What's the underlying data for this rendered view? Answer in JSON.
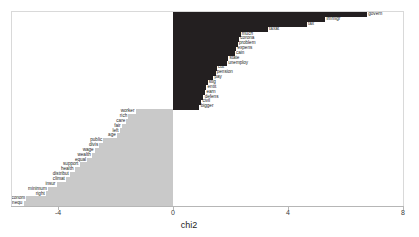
{
  "chart_data": {
    "type": "bar",
    "orientation": "horizontal",
    "title": "",
    "xlabel": "chi2",
    "ylabel": "",
    "xlim": [
      -5.6,
      8.0
    ],
    "xticks": [
      -4,
      0,
      4,
      8
    ],
    "xticklabels": [
      "-4",
      "0",
      "4",
      "8"
    ],
    "grid": false,
    "legend": null,
    "colors": {
      "positive": "#231f20",
      "negative": "#c9c9c9",
      "panel": "#ffffff",
      "axis": "#b6b6b6",
      "text": "#1c1c1c"
    },
    "series": [
      {
        "name": "chi2",
        "points": [
          {
            "label": "govern",
            "value": 6.75,
            "sign": "positive"
          },
          {
            "label": "immigr",
            "value": 5.3,
            "sign": "positive"
          },
          {
            "label": "tax",
            "value": 4.65,
            "sign": "positive"
          },
          {
            "label": "taxat",
            "value": 3.3,
            "sign": "positive"
          },
          {
            "label": "much",
            "value": 2.35,
            "sign": "positive"
          },
          {
            "label": "corona",
            "value": 2.3,
            "sign": "positive"
          },
          {
            "label": "problem",
            "value": 2.25,
            "sign": "positive"
          },
          {
            "label": "expens",
            "value": 2.2,
            "sign": "positive"
          },
          {
            "label": "cain",
            "value": 2.15,
            "sign": "positive"
          },
          {
            "label": "state",
            "value": 1.92,
            "sign": "positive"
          },
          {
            "label": "unemploy",
            "value": 1.88,
            "sign": "positive"
          },
          {
            "label": "cut",
            "value": 1.52,
            "sign": "positive"
          },
          {
            "label": "pension",
            "value": 1.48,
            "sign": "positive"
          },
          {
            "label": "pay",
            "value": 1.4,
            "sign": "positive"
          },
          {
            "label": "stig",
            "value": 1.2,
            "sign": "positive"
          },
          {
            "label": "entit",
            "value": 1.16,
            "sign": "positive"
          },
          {
            "label": "earn",
            "value": 1.12,
            "sign": "positive"
          },
          {
            "label": "defens",
            "value": 1.06,
            "sign": "positive"
          },
          {
            "label": "civil",
            "value": 0.98,
            "sign": "positive"
          },
          {
            "label": "bigger",
            "value": 0.92,
            "sign": "positive"
          },
          {
            "label": "worker",
            "value": -1.3,
            "sign": "negative"
          },
          {
            "label": "rich",
            "value": -1.55,
            "sign": "negative"
          },
          {
            "label": "care",
            "value": -1.62,
            "sign": "negative"
          },
          {
            "label": "fair",
            "value": -1.78,
            "sign": "negative"
          },
          {
            "label": "left",
            "value": -1.85,
            "sign": "negative"
          },
          {
            "label": "age",
            "value": -1.95,
            "sign": "negative"
          },
          {
            "label": "public",
            "value": -2.42,
            "sign": "negative"
          },
          {
            "label": "divis",
            "value": -2.56,
            "sign": "negative"
          },
          {
            "label": "wage",
            "value": -2.72,
            "sign": "negative"
          },
          {
            "label": "wealth",
            "value": -2.82,
            "sign": "negative"
          },
          {
            "label": "equal",
            "value": -2.98,
            "sign": "negative"
          },
          {
            "label": "support",
            "value": -3.25,
            "sign": "negative"
          },
          {
            "label": "health",
            "value": -3.42,
            "sign": "negative"
          },
          {
            "label": "distribut",
            "value": -3.58,
            "sign": "negative"
          },
          {
            "label": "climat",
            "value": -3.72,
            "sign": "negative"
          },
          {
            "label": "insur",
            "value": -4.05,
            "sign": "negative"
          },
          {
            "label": "minimum",
            "value": -4.35,
            "sign": "negative"
          },
          {
            "label": "right",
            "value": -4.42,
            "sign": "negative"
          },
          {
            "label": "econom",
            "value": -5.1,
            "sign": "negative"
          },
          {
            "label": "inequ",
            "value": -5.2,
            "sign": "negative"
          }
        ]
      }
    ]
  }
}
